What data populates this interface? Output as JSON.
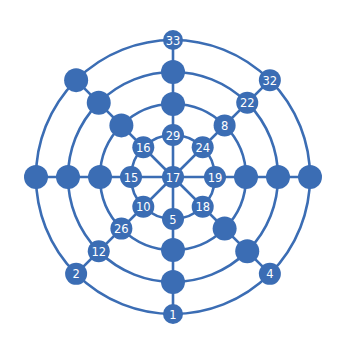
{
  "diagram": {
    "center": [
      173,
      177
    ],
    "color": "#3b6db4",
    "ring_radii": [
      42,
      73,
      105,
      137
    ],
    "spoke_angles_deg": [
      270,
      315,
      0,
      45,
      90,
      135,
      180,
      225
    ],
    "nodes": [
      {
        "id": "center",
        "angle": 0,
        "r": 0,
        "label": "17",
        "size": 11
      },
      {
        "id": "n-top-1",
        "angle": 270,
        "r": 42,
        "label": "29",
        "size": 11
      },
      {
        "id": "n-top-2",
        "angle": 270,
        "r": 73,
        "label": "",
        "size": 12
      },
      {
        "id": "n-top-3",
        "angle": 270,
        "r": 105,
        "label": "",
        "size": 12
      },
      {
        "id": "n-top-4",
        "angle": 270,
        "r": 137,
        "label": "33",
        "size": 10
      },
      {
        "id": "n-ne-1",
        "angle": 315,
        "r": 42,
        "label": "24",
        "size": 11
      },
      {
        "id": "n-ne-2",
        "angle": 315,
        "r": 73,
        "label": "8",
        "size": 11
      },
      {
        "id": "n-ne-3",
        "angle": 315,
        "r": 105,
        "label": "22",
        "size": 11
      },
      {
        "id": "n-ne-4",
        "angle": 315,
        "r": 137,
        "label": "32",
        "size": 11
      },
      {
        "id": "n-e-1",
        "angle": 0,
        "r": 42,
        "label": "19",
        "size": 11
      },
      {
        "id": "n-e-2",
        "angle": 0,
        "r": 73,
        "label": "",
        "size": 12
      },
      {
        "id": "n-e-3",
        "angle": 0,
        "r": 105,
        "label": "",
        "size": 12
      },
      {
        "id": "n-e-4",
        "angle": 0,
        "r": 137,
        "label": "",
        "size": 12
      },
      {
        "id": "n-se-1",
        "angle": 45,
        "r": 42,
        "label": "18",
        "size": 11
      },
      {
        "id": "n-se-2",
        "angle": 45,
        "r": 73,
        "label": "",
        "size": 12
      },
      {
        "id": "n-se-3",
        "angle": 45,
        "r": 105,
        "label": "",
        "size": 12
      },
      {
        "id": "n-se-4",
        "angle": 45,
        "r": 137,
        "label": "4",
        "size": 11
      },
      {
        "id": "n-s-1",
        "angle": 90,
        "r": 42,
        "label": "5",
        "size": 11
      },
      {
        "id": "n-s-2",
        "angle": 90,
        "r": 73,
        "label": "",
        "size": 12
      },
      {
        "id": "n-s-3",
        "angle": 90,
        "r": 105,
        "label": "",
        "size": 12
      },
      {
        "id": "n-s-4",
        "angle": 90,
        "r": 137,
        "label": "1",
        "size": 10
      },
      {
        "id": "n-sw-1",
        "angle": 135,
        "r": 42,
        "label": "10",
        "size": 11
      },
      {
        "id": "n-sw-2",
        "angle": 135,
        "r": 73,
        "label": "26",
        "size": 11
      },
      {
        "id": "n-sw-3",
        "angle": 135,
        "r": 105,
        "label": "12",
        "size": 11
      },
      {
        "id": "n-sw-4",
        "angle": 135,
        "r": 137,
        "label": "2",
        "size": 11
      },
      {
        "id": "n-w-1",
        "angle": 180,
        "r": 42,
        "label": "15",
        "size": 11
      },
      {
        "id": "n-w-2",
        "angle": 180,
        "r": 73,
        "label": "",
        "size": 12
      },
      {
        "id": "n-w-3",
        "angle": 180,
        "r": 105,
        "label": "",
        "size": 12
      },
      {
        "id": "n-w-4",
        "angle": 180,
        "r": 137,
        "label": "",
        "size": 12
      },
      {
        "id": "n-nw-1",
        "angle": 225,
        "r": 42,
        "label": "16",
        "size": 11
      },
      {
        "id": "n-nw-2",
        "angle": 225,
        "r": 73,
        "label": "",
        "size": 12
      },
      {
        "id": "n-nw-3",
        "angle": 225,
        "r": 105,
        "label": "",
        "size": 12
      },
      {
        "id": "n-nw-4",
        "angle": 225,
        "r": 137,
        "label": "",
        "size": 12
      }
    ]
  }
}
